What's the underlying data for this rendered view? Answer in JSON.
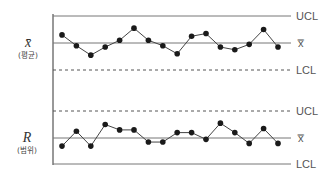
{
  "chart_data": {
    "type": "line",
    "panels": [
      {
        "name": "xbar",
        "ylabel": "x̄",
        "ylabel_sub": "(평균)",
        "limits": {
          "UCL": "UCL",
          "CL": "x̿",
          "LCL": "LCL"
        },
        "ucl_style": "solid",
        "lcl_style": "dashed",
        "range": [
          -1,
          1
        ],
        "values": [
          0.3,
          -0.1,
          -0.45,
          -0.15,
          0.1,
          0.55,
          0.1,
          -0.1,
          -0.4,
          0.25,
          0.35,
          -0.15,
          -0.25,
          -0.05,
          0.5,
          -0.15
        ]
      },
      {
        "name": "range",
        "ylabel": "R",
        "ylabel_sub": "(범위)",
        "limits": {
          "UCL": "UCL",
          "CL": "x̿",
          "LCL": "LCL"
        },
        "ucl_style": "dashed",
        "lcl_style": "solid",
        "range": [
          -1,
          1
        ],
        "values": [
          -0.3,
          0.25,
          -0.3,
          0.5,
          0.3,
          0.3,
          -0.15,
          -0.15,
          0.2,
          0.2,
          -0.05,
          0.55,
          0.2,
          -0.2,
          0.35,
          -0.2
        ]
      }
    ],
    "grid": false
  }
}
